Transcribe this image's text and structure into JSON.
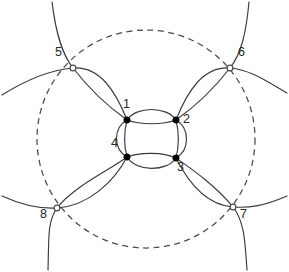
{
  "figure": {
    "canvas": {
      "width": 289,
      "height": 272,
      "background": "#ffffff"
    },
    "stroke_color": "#3a3a3a",
    "dash_color": "#4a4a4a",
    "label_color": "#262626",
    "marker_fill_filled": "#000000",
    "marker_fill_hollow": "#ffffff"
  },
  "chart_data": {
    "type": "scatter",
    "xlabel": "",
    "ylabel": "",
    "grid": false,
    "legend": "none",
    "xlim": [
      0,
      289
    ],
    "ylim": [
      0,
      272
    ],
    "points": [
      {
        "label": "1",
        "x": 127,
        "y": 120,
        "marker": "filled",
        "label_dx": -4,
        "label_dy": -16
      },
      {
        "label": "2",
        "x": 176,
        "y": 120,
        "marker": "filled",
        "label_dx": 7,
        "label_dy": -1
      },
      {
        "label": "3",
        "x": 176,
        "y": 158,
        "marker": "filled",
        "label_dx": 1,
        "label_dy": 9
      },
      {
        "label": "4",
        "x": 127,
        "y": 157,
        "marker": "filled",
        "label_dx": -16,
        "label_dy": -14
      },
      {
        "label": "5",
        "x": 73,
        "y": 68,
        "marker": "hollow",
        "label_dx": -18,
        "label_dy": -16
      },
      {
        "label": "6",
        "x": 230,
        "y": 68,
        "marker": "hollow",
        "label_dx": 8,
        "label_dy": -16
      },
      {
        "label": "7",
        "x": 233,
        "y": 207,
        "marker": "hollow",
        "label_dx": 7,
        "label_dy": 7
      },
      {
        "label": "8",
        "x": 57,
        "y": 208,
        "marker": "hollow",
        "label_dx": -17,
        "label_dy": 6
      }
    ],
    "dashed_circle": {
      "cx": 146,
      "cy": 139,
      "r": 109,
      "style": "dashed"
    },
    "solid_circles": [
      {
        "name": "inner-circle",
        "cx": 151.5,
        "cy": 139,
        "r": 27
      },
      {
        "name": "circle-through-1-5",
        "cx": 100,
        "cy": 94,
        "r": 38
      },
      {
        "name": "circle-through-2-6",
        "cx": 203,
        "cy": 94,
        "r": 38
      },
      {
        "name": "circle-through-3-7",
        "cx": 204,
        "cy": 182,
        "r": 39
      },
      {
        "name": "circle-through-4-8",
        "cx": 92,
        "cy": 182,
        "r": 45
      }
    ]
  }
}
